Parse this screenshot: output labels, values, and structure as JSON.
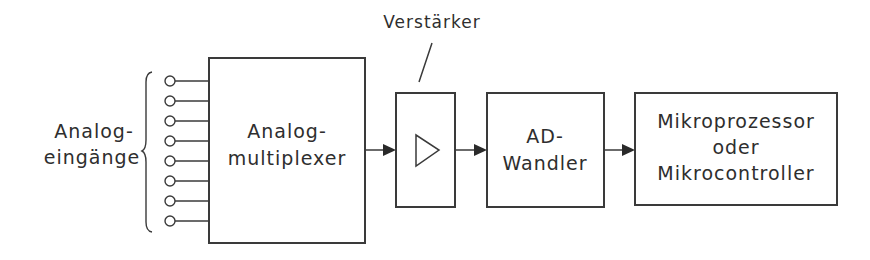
{
  "diagram": {
    "inputs": {
      "label_line1": "Analog-",
      "label_line2": "eingänge",
      "count": 8
    },
    "multiplexer": {
      "line1": "Analog-",
      "line2": "multiplexer"
    },
    "amplifier": {
      "callout": "Verstärker",
      "symbol": "triangle-amplifier-icon"
    },
    "adc": {
      "line1": "AD-",
      "line2": "Wandler"
    },
    "processor": {
      "line1": "Mikroprozessor",
      "line2": "oder",
      "line3": "Mikrocontroller"
    },
    "connections": [
      {
        "from": "multiplexer",
        "to": "amplifier"
      },
      {
        "from": "amplifier",
        "to": "adc"
      },
      {
        "from": "adc",
        "to": "processor"
      }
    ]
  }
}
